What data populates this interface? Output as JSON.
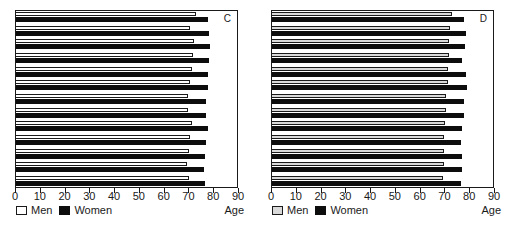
{
  "figure": {
    "axis_title": "Age",
    "legend": {
      "men_label": "Men",
      "women_label": "Women"
    },
    "ticks": [
      0,
      10,
      20,
      30,
      40,
      50,
      60,
      70,
      80,
      90
    ]
  },
  "chart_data": [
    {
      "type": "bar",
      "panel": "C",
      "title": "",
      "xlabel": "Age",
      "ylabel": "",
      "xlim": [
        0,
        90
      ],
      "orientation": "horizontal",
      "grid": false,
      "legend_position": "bottom-left",
      "categories": [
        "1",
        "2",
        "3",
        "4",
        "5",
        "6",
        "7",
        "8",
        "9",
        "10",
        "11",
        "12",
        "13"
      ],
      "series": [
        {
          "name": "Men",
          "color": "#ffffff",
          "values": [
            73.5,
            71.0,
            72.5,
            72.0,
            71.5,
            71.0,
            70.0,
            70.0,
            71.5,
            71.0,
            70.5,
            69.5,
            70.5
          ]
        },
        {
          "name": "Women",
          "color": "#0d0d0d",
          "values": [
            78.0,
            78.5,
            79.0,
            78.5,
            78.0,
            78.0,
            77.5,
            77.5,
            78.0,
            77.5,
            77.0,
            76.5,
            77.0
          ]
        }
      ]
    },
    {
      "type": "bar",
      "panel": "D",
      "title": "",
      "xlabel": "Age",
      "ylabel": "",
      "xlim": [
        0,
        90
      ],
      "orientation": "horizontal",
      "grid": false,
      "legend_position": "bottom-left",
      "categories": [
        "1",
        "2",
        "3",
        "4",
        "5",
        "6",
        "7",
        "8",
        "9",
        "10",
        "11",
        "12",
        "13"
      ],
      "series": [
        {
          "name": "Men",
          "color": "#d9d9d9",
          "values": [
            73.5,
            72.5,
            72.0,
            72.0,
            71.5,
            71.5,
            71.0,
            71.0,
            70.5,
            70.0,
            70.0,
            70.0,
            69.5
          ]
        },
        {
          "name": "Women",
          "color": "#0d0d0d",
          "values": [
            78.0,
            79.0,
            78.5,
            77.5,
            79.0,
            79.5,
            78.0,
            78.0,
            77.5,
            77.0,
            77.5,
            77.5,
            77.0
          ]
        }
      ]
    }
  ]
}
